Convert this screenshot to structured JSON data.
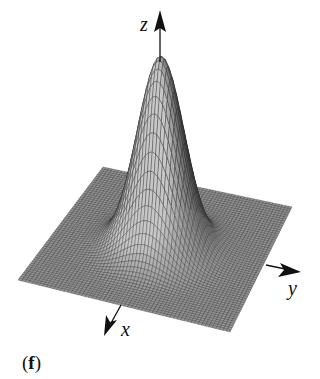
{
  "figure": {
    "panel_label_open": "(",
    "panel_label_letter": "f",
    "panel_label_close": ")",
    "axes": {
      "z_label": "z",
      "y_label": "y",
      "x_label": "x"
    },
    "surface": {
      "type": "gaussian-peak",
      "grid_lines": 60,
      "colors": {
        "mesh_fill_dark": "#3a3a3a",
        "mesh_fill_light": "#bdbdbd",
        "mesh_line": "#2b2b2b",
        "axis": "#111111"
      }
    }
  }
}
